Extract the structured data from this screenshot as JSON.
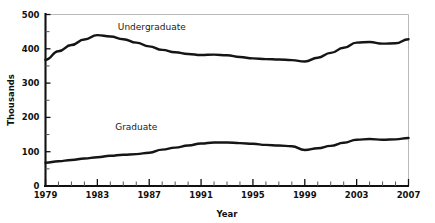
{
  "chart_data": {
    "type": "line",
    "title": "",
    "xlabel": "Year",
    "ylabel": "Thousands",
    "xlim": [
      1979,
      2007
    ],
    "ylim": [
      0,
      500
    ],
    "grid": false,
    "legend_position": "inline-annotation",
    "y_ticks_major": [
      0,
      100,
      200,
      300,
      400,
      500
    ],
    "y_ticks_minor": [
      50,
      150,
      250,
      350,
      450
    ],
    "y_tick_labels": [
      "0",
      "100",
      "200",
      "300",
      "400",
      "500"
    ],
    "x_ticks_major": [
      1979,
      1983,
      1987,
      1991,
      1995,
      1999,
      2003,
      2007
    ],
    "x_tick_labels": [
      "1979",
      "1983",
      "1987",
      "1991",
      "1995",
      "1999",
      "2003",
      "2007"
    ],
    "x": [
      1979,
      1980,
      1981,
      1982,
      1983,
      1984,
      1985,
      1986,
      1987,
      1988,
      1989,
      1990,
      1991,
      1992,
      1993,
      1994,
      1995,
      1996,
      1997,
      1998,
      1999,
      2000,
      2001,
      2002,
      2003,
      2004,
      2005,
      2006,
      2007
    ],
    "series": [
      {
        "name": "Undergraduate",
        "label_text": "Undergraduate",
        "color": "#151515",
        "values": [
          368,
          393,
          411,
          427,
          440,
          436,
          428,
          418,
          407,
          397,
          390,
          385,
          382,
          383,
          381,
          376,
          372,
          370,
          369,
          367,
          363,
          374,
          388,
          403,
          418,
          420,
          415,
          416,
          428
        ]
      },
      {
        "name": "Graduate",
        "label_text": "Graduate",
        "color": "#151515",
        "values": [
          68,
          72,
          76,
          80,
          84,
          88,
          91,
          93,
          97,
          106,
          112,
          118,
          124,
          127,
          127,
          125,
          123,
          120,
          118,
          116,
          105,
          110,
          117,
          126,
          135,
          137,
          135,
          136,
          140
        ]
      }
    ],
    "annotations": [
      {
        "text": "Undergraduate",
        "x": 1987.2,
        "y": 455
      },
      {
        "text": "Graduate",
        "x": 1986.0,
        "y": 163
      }
    ]
  }
}
